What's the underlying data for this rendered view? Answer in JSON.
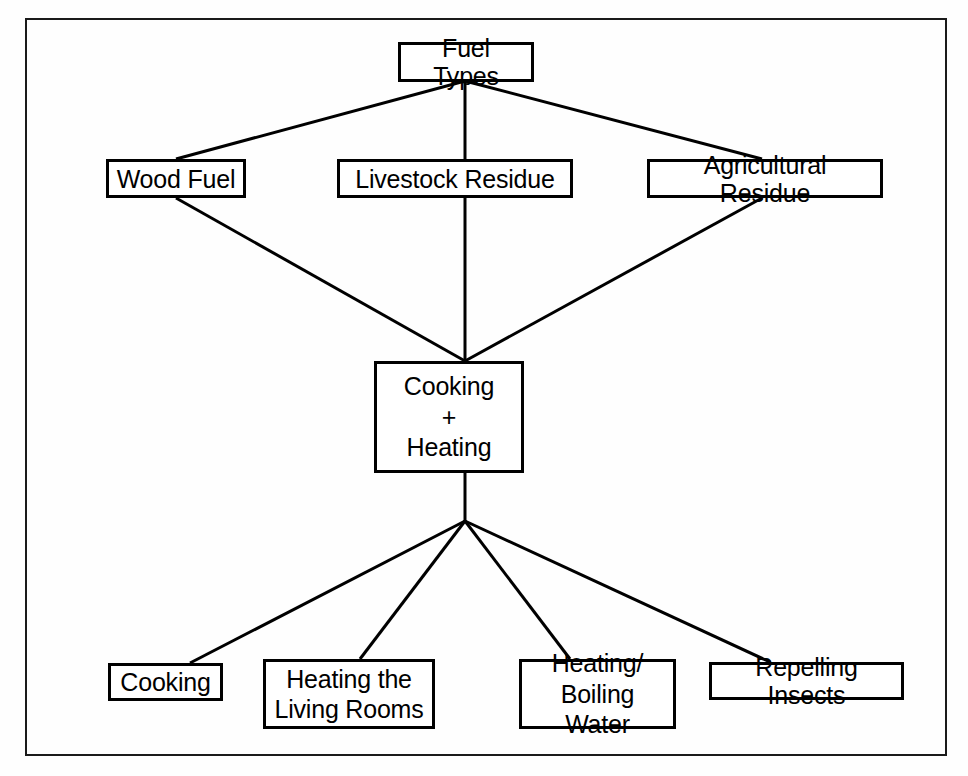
{
  "diagram": {
    "frame": {
      "stroke": "#1a1a1a",
      "fill": "#fefefe"
    },
    "node_style": {
      "stroke": "#000000",
      "fill": "#ffffff",
      "text_color": "#000000"
    },
    "nodes": {
      "root": {
        "label": "Fuel Types"
      },
      "fuel_1": {
        "label": "Wood Fuel"
      },
      "fuel_2": {
        "label": "Livestock Residue"
      },
      "fuel_3": {
        "label": "Agricultural Residue"
      },
      "combined": {
        "label": "Cooking\n+\nHeating"
      },
      "use_1": {
        "label": "Cooking"
      },
      "use_2": {
        "label": "Heating the\nLiving Rooms"
      },
      "use_3": {
        "label": "Heating/\nBoiling Water"
      },
      "use_4": {
        "label": "Repelling Insects"
      }
    },
    "edges": [
      {
        "from": "root",
        "to": "fuel_1"
      },
      {
        "from": "root",
        "to": "fuel_2"
      },
      {
        "from": "root",
        "to": "fuel_3"
      },
      {
        "from": "fuel_1",
        "to": "combined"
      },
      {
        "from": "fuel_2",
        "to": "combined"
      },
      {
        "from": "fuel_3",
        "to": "combined"
      },
      {
        "from": "combined",
        "to": "use_1"
      },
      {
        "from": "combined",
        "to": "use_2"
      },
      {
        "from": "combined",
        "to": "use_3"
      },
      {
        "from": "combined",
        "to": "use_4"
      }
    ]
  }
}
